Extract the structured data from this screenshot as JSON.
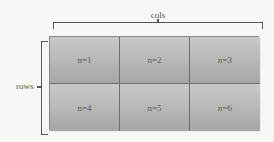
{
  "labels": {
    "cols": "cols",
    "rows": "rows"
  },
  "grid": {
    "rows": 2,
    "cols": 3,
    "cells": [
      "n=1",
      "n=2",
      "n=3",
      "n=4",
      "n=5",
      "n=6"
    ]
  },
  "colors": {
    "cell_top": "#c8c8c8",
    "cell_bottom": "#a6a6a6",
    "divider": "#6e6e6e",
    "brace": "#555555",
    "background": "#f7f7f5"
  }
}
